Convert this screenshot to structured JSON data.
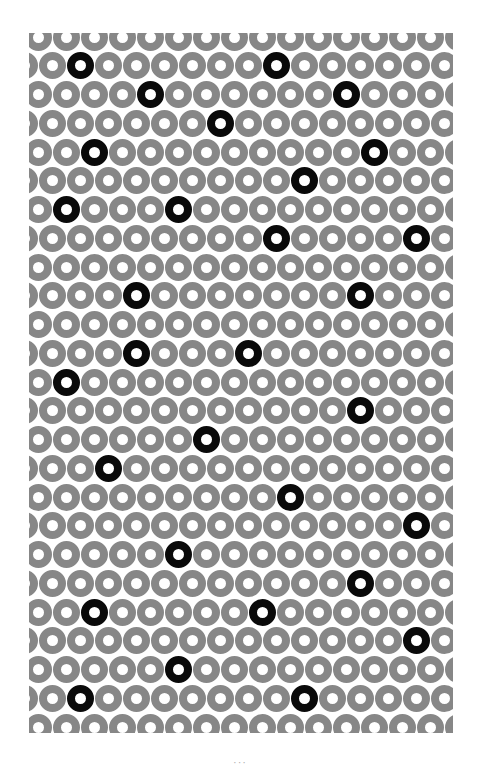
{
  "figure": {
    "box": {
      "left": 29,
      "top": 33,
      "width": 424,
      "height": 700
    },
    "colors": {
      "ring": "#878787",
      "highlight_ring": "#0a0a0a",
      "background": "#ffffff"
    },
    "ring": {
      "outer_diameter": 27,
      "hole_diameter": 10
    },
    "grid": {
      "row_count": 25,
      "row_pitch": 28.75,
      "first_row_center_y": 37,
      "col_pitch": 28,
      "even_row_first_center_x": 38,
      "odd_row_first_center_x": 24,
      "cols_per_row": 16
    },
    "black_rings": [
      {
        "row": 1,
        "col": 2
      },
      {
        "row": 1,
        "col": 9
      },
      {
        "row": 2,
        "col": 4
      },
      {
        "row": 2,
        "col": 11
      },
      {
        "row": 3,
        "col": 7
      },
      {
        "row": 4,
        "col": 2
      },
      {
        "row": 4,
        "col": 12
      },
      {
        "row": 5,
        "col": 10
      },
      {
        "row": 6,
        "col": 1
      },
      {
        "row": 6,
        "col": 5
      },
      {
        "row": 7,
        "col": 9
      },
      {
        "row": 7,
        "col": 14
      },
      {
        "row": 9,
        "col": 4
      },
      {
        "row": 9,
        "col": 12
      },
      {
        "row": 11,
        "col": 4
      },
      {
        "row": 11,
        "col": 8
      },
      {
        "row": 12,
        "col": 1
      },
      {
        "row": 13,
        "col": 12
      },
      {
        "row": 14,
        "col": 6
      },
      {
        "row": 15,
        "col": 3
      },
      {
        "row": 16,
        "col": 9
      },
      {
        "row": 17,
        "col": 14
      },
      {
        "row": 18,
        "col": 5
      },
      {
        "row": 19,
        "col": 12
      },
      {
        "row": 20,
        "col": 2
      },
      {
        "row": 20,
        "col": 8
      },
      {
        "row": 21,
        "col": 14
      },
      {
        "row": 22,
        "col": 5
      },
      {
        "row": 23,
        "col": 2
      },
      {
        "row": 23,
        "col": 10
      }
    ]
  },
  "footer": {
    "page_marker": "···"
  }
}
